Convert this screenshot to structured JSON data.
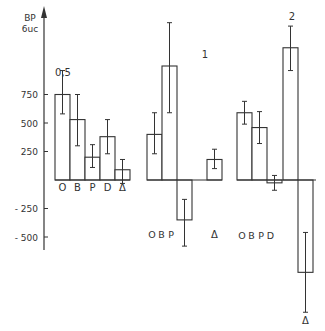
{
  "chart_data": {
    "type": "bar",
    "title": "",
    "ylabel": "BP\n6uc",
    "ylabel_lines": [
      "BP",
      "6uc"
    ],
    "xlabel": "",
    "ylim": [
      -900,
      1300
    ],
    "yticks": [
      750,
      500,
      250,
      -250,
      -500
    ],
    "grid": false,
    "legend": null,
    "colors": {
      "stroke": "#333333",
      "fill": "#ffffff"
    },
    "groups": [
      {
        "label": "0,5",
        "categories": [
          "O",
          "B",
          "P",
          "D",
          "Δ"
        ],
        "values": [
          750,
          530,
          200,
          380,
          90
        ],
        "errors": [
          [
            580,
            960
          ],
          [
            300,
            750
          ],
          [
            110,
            310
          ],
          [
            230,
            530
          ],
          [
            -30,
            180
          ]
        ]
      },
      {
        "label": "1",
        "categories": [
          "O",
          "B",
          "P",
          "D",
          "Δ"
        ],
        "values": [
          400,
          1000,
          -350,
          null,
          180
        ],
        "errors": [
          [
            230,
            590
          ],
          [
            590,
            1380
          ],
          [
            -170,
            -580
          ],
          null,
          [
            100,
            270
          ]
        ],
        "visible_category_labels": [
          "O",
          "B",
          "P",
          "",
          "Δ"
        ]
      },
      {
        "label": "2",
        "categories": [
          "O",
          "B",
          "P",
          "D",
          "Δ"
        ],
        "values": [
          590,
          460,
          -25,
          1160,
          -810
        ],
        "errors": [
          [
            490,
            690
          ],
          [
            320,
            600
          ],
          [
            -90,
            40
          ],
          [
            960,
            1350
          ],
          [
            -460,
            -1160
          ]
        ]
      }
    ]
  }
}
